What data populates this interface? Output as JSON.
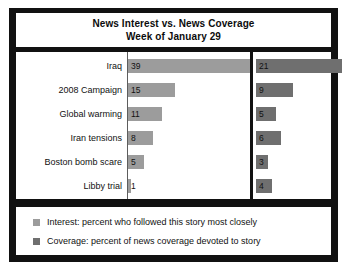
{
  "chart_data": {
    "type": "bar",
    "title": "News Interest vs. News Coverage",
    "subtitle": "Week of January 29",
    "title_lines": [
      "News Interest vs. News Coverage",
      "Week of January 29"
    ],
    "orientation": "horizontal",
    "grid": false,
    "legend_position": "bottom",
    "xlabel": "",
    "ylabel": "",
    "xlim": [
      0,
      39
    ],
    "categories": [
      "Iraq",
      "2008 Campaign",
      "Global warming",
      "Iran tensions",
      "Boston bomb scare",
      "Libby trial"
    ],
    "series": [
      {
        "name": "Interest",
        "legend_label": "Interest: percent who followed this story most closely",
        "color": "#9c9c9c",
        "values": [
          39,
          15,
          11,
          8,
          5,
          1
        ]
      },
      {
        "name": "Coverage",
        "legend_label": "Coverage: percent of news coverage devoted to story",
        "color": "#6f6f6f",
        "values": [
          21,
          9,
          5,
          6,
          3,
          4
        ]
      }
    ]
  },
  "colors": {
    "interest": "#9c9c9c",
    "coverage": "#6f6f6f",
    "frame": "#111111",
    "panel": "#ffffff"
  }
}
